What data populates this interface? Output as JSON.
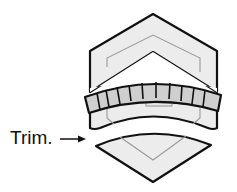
{
  "diagram": {
    "label": "Trim.",
    "colors": {
      "stroke": "#111111",
      "fill_light": "#ececec",
      "fill_band": "#cfcfcf",
      "guide_line": "#9a9a9a",
      "text": "#111111",
      "background": "#ffffff"
    },
    "parts": [
      {
        "name": "upper-chevron-body",
        "description": "Hexagonal chevron upper piece with inner guide outline"
      },
      {
        "name": "segmented-band",
        "description": "Curved band made of 11 rectangular segments"
      },
      {
        "name": "lower-body",
        "description": "Curved lower portion of the body below the band"
      },
      {
        "name": "trimmed-piece",
        "description": "Separated lower diamond-shaped piece being trimmed off"
      },
      {
        "name": "trim-arrow",
        "description": "Arrow pointing from the label to the trimmed piece"
      }
    ],
    "band_segment_count": 11
  }
}
